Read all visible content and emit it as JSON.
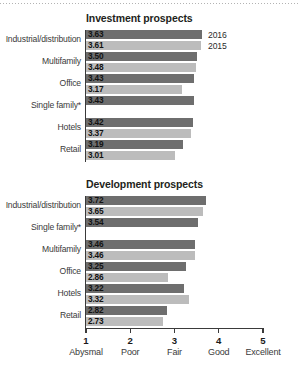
{
  "chart_data": [
    {
      "type": "bar",
      "title": "Investment prospects",
      "orientation": "horizontal",
      "xlabel": "",
      "ylabel": "",
      "xlim": [
        1,
        5
      ],
      "grid": false,
      "legend_position": "top-right",
      "categories": [
        "Industrial/distribution",
        "Multifamily",
        "Office",
        "Single family*",
        "Hotels",
        "Retail"
      ],
      "series": [
        {
          "name": "2016",
          "color": "#6e6e6e",
          "values": [
            3.63,
            3.5,
            3.43,
            3.43,
            3.42,
            3.19
          ]
        },
        {
          "name": "2015",
          "color": "#bcbcbc",
          "values": [
            3.61,
            3.48,
            3.17,
            null,
            3.37,
            3.01
          ]
        }
      ],
      "ticks": [
        {
          "value": 1,
          "num": "1",
          "word": "Abysmal"
        },
        {
          "value": 2,
          "num": "2",
          "word": "Poor"
        },
        {
          "value": 3,
          "num": "3",
          "word": "Fair"
        },
        {
          "value": 4,
          "num": "4",
          "word": "Good"
        },
        {
          "value": 5,
          "num": "5",
          "word": "Excellent"
        }
      ]
    },
    {
      "type": "bar",
      "title": "Development prospects",
      "orientation": "horizontal",
      "xlabel": "",
      "ylabel": "",
      "xlim": [
        1,
        5
      ],
      "grid": false,
      "legend_position": "none",
      "categories": [
        "Industrial/distribution",
        "Single family*",
        "Multifamily",
        "Office",
        "Hotels",
        "Retail"
      ],
      "series": [
        {
          "name": "2016",
          "color": "#6e6e6e",
          "values": [
            3.72,
            3.54,
            3.46,
            3.25,
            3.22,
            2.82
          ]
        },
        {
          "name": "2015",
          "color": "#bcbcbc",
          "values": [
            3.65,
            null,
            3.46,
            2.86,
            3.32,
            2.73
          ]
        }
      ],
      "ticks": [
        {
          "value": 1,
          "num": "1",
          "word": "Abysmal"
        },
        {
          "value": 2,
          "num": "2",
          "word": "Poor"
        },
        {
          "value": 3,
          "num": "3",
          "word": "Fair"
        },
        {
          "value": 4,
          "num": "4",
          "word": "Good"
        },
        {
          "value": 5,
          "num": "5",
          "word": "Excellent"
        }
      ]
    }
  ],
  "legend": {
    "entries": [
      {
        "label": "2016",
        "color": "#6e6e6e"
      },
      {
        "label": "2015",
        "color": "#bcbcbc"
      }
    ]
  },
  "labels": {
    "value_format": "0.00"
  }
}
